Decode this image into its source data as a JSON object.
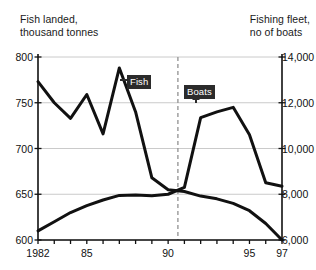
{
  "axes": {
    "left_title": "Fish landed,\nthousand tonnes",
    "right_title": "Fishing fleet,\nno of boats",
    "left_ticks": [
      "800",
      "750",
      "700",
      "650",
      "600"
    ],
    "right_ticks": [
      "14,000",
      "12,000",
      "10,000",
      "8,000",
      "6,000"
    ],
    "x_ticks": [
      "1982",
      "85",
      "90",
      "95",
      "97"
    ]
  },
  "annotations": {
    "fish_label": "Fish",
    "boats_label": "Boats"
  },
  "chart_data": {
    "type": "line",
    "title": "",
    "xlabel": "",
    "ylabel": "Fish landed, thousand tonnes",
    "y2label": "Fishing fleet, no of boats",
    "grid": true,
    "legend_position": "inline-callouts",
    "x": [
      1982,
      1983,
      1984,
      1985,
      1986,
      1987,
      1988,
      1989,
      1990,
      1991,
      1992,
      1993,
      1994,
      1995,
      1996,
      1997
    ],
    "xlim": [
      1982,
      1997
    ],
    "ylim": [
      600,
      800
    ],
    "y2lim": [
      6000,
      14000
    ],
    "y_ticks": [
      600,
      650,
      700,
      750,
      800
    ],
    "y2_ticks": [
      6000,
      8000,
      10000,
      12000,
      14000
    ],
    "x_tick_labels": {
      "1982": "1982",
      "1985": "85",
      "1990": "90",
      "1995": "95",
      "1997": "97"
    },
    "reference_line": {
      "x": 1990.6,
      "style": "dashed",
      "color": "#999999"
    },
    "series": [
      {
        "name": "Fish",
        "axis": "left",
        "units": "thousand tonnes",
        "color": "#111111",
        "values": [
          773,
          750,
          733,
          759,
          716,
          788,
          740,
          668,
          655,
          653,
          648,
          645,
          640,
          632,
          618,
          600
        ]
      },
      {
        "name": "Boats",
        "axis": "right",
        "units": "no of boats",
        "color": "#111111",
        "values": [
          6400,
          6800,
          7200,
          7500,
          7750,
          7950,
          7970,
          7930,
          8000,
          8300,
          11350,
          11600,
          11800,
          10600,
          8500,
          8350
        ]
      }
    ]
  }
}
